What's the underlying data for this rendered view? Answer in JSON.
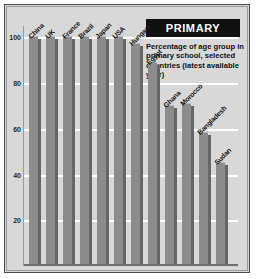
{
  "title": "PRIMARY",
  "subtitle": "Percentage of age group in primary school, selected countries (latest available year)",
  "chart_data": {
    "type": "bar",
    "title": "PRIMARY",
    "subtitle": "Percentage of age group in primary school, selected countries (latest available year)",
    "xlabel": "",
    "ylabel": "",
    "ylim": [
      0,
      105
    ],
    "yticks": [
      100,
      80,
      60,
      40,
      20
    ],
    "grid": true,
    "legend": null,
    "categories": [
      "China",
      "UK",
      "France",
      "Brazil",
      "Japan",
      "USA",
      "Hungary",
      "Egypt",
      "Ghana",
      "Morocco",
      "Bangladesh",
      "Sudan"
    ],
    "values": [
      100,
      100,
      100,
      100,
      100,
      100,
      97,
      89,
      70,
      71,
      58,
      45
    ]
  }
}
